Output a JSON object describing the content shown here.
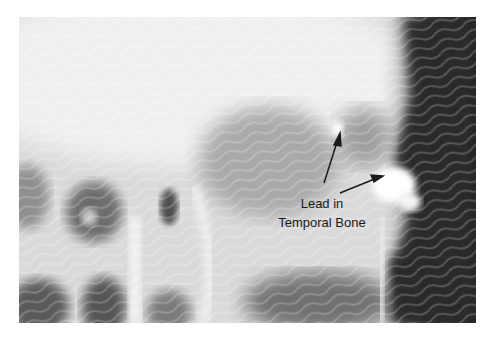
{
  "figure": {
    "type": "radiograph",
    "annotation": {
      "line1": "Lead in",
      "line2": "Temporal Bone",
      "arrows": 2
    },
    "colors": {
      "background": "#ffffff",
      "bone_light": "#efefef",
      "mid_gray": "#a8a8a8",
      "dark_region": "#2a2a2a",
      "text": "#1a1a1a"
    }
  }
}
